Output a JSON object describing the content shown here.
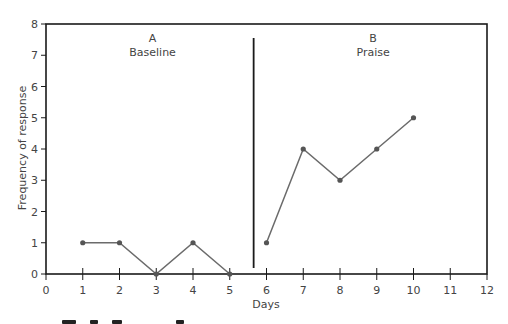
{
  "chart_data": {
    "type": "line",
    "title": "",
    "xlabel": "Days",
    "ylabel": "Frequency of response",
    "xlim": [
      0,
      12
    ],
    "ylim": [
      0,
      8
    ],
    "x_ticks": [
      0,
      1,
      2,
      3,
      4,
      5,
      6,
      7,
      8,
      9,
      10,
      11,
      12
    ],
    "y_ticks": [
      0,
      1,
      2,
      3,
      4,
      5,
      6,
      7,
      8
    ],
    "grid": false,
    "legend": "none",
    "phase_divider_x": 5.65,
    "phases": [
      {
        "letter": "A",
        "name": "Baseline",
        "label_x": 2.9
      },
      {
        "letter": "B",
        "name": "Praise",
        "label_x": 8.9
      }
    ],
    "series": [
      {
        "name": "A Baseline",
        "x": [
          1,
          2,
          3,
          4,
          5
        ],
        "values": [
          1,
          1,
          0,
          1,
          0
        ]
      },
      {
        "name": "B Praise",
        "x": [
          6,
          7,
          8,
          9,
          10
        ],
        "values": [
          1,
          4,
          3,
          4,
          5
        ]
      }
    ],
    "colors": {
      "axis": "#1a1a1a",
      "line": "#6b6b6b",
      "marker": "#555555",
      "text": "#444444"
    }
  }
}
